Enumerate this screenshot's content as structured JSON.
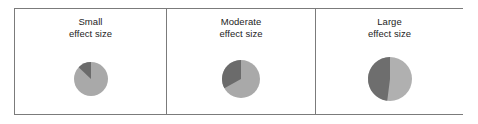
{
  "figure": {
    "border_color": "#7b7b7b",
    "background": "#ffffff",
    "caption_color": "#1d1d1d"
  },
  "panels": [
    {
      "name": "small",
      "caption": "Small\neffect size",
      "caption_line1": "Small",
      "caption_line2": "effect size",
      "pie_radius": 17,
      "center_x": 89,
      "center_y": 80
    },
    {
      "name": "moderate",
      "caption": "Moderate\neffect size",
      "caption_line1": "Moderate",
      "caption_line2": "effect size",
      "pie_radius": 19,
      "center_x": 238,
      "center_y": 82
    },
    {
      "name": "large",
      "caption": "Large\neffect size",
      "caption_line1": "Large",
      "caption_line2": "effect size",
      "pie_radius": 22,
      "center_x": 388,
      "center_y": 82
    }
  ],
  "chart_data": [
    {
      "type": "pie",
      "title": "Small effect size",
      "labels": [
        "overlap",
        "effect"
      ],
      "values": [
        87,
        13
      ],
      "colors": [
        "#a9a9a9",
        "#6b6b6b"
      ],
      "start_angle_deg": 0,
      "direction": "clockwise",
      "radius_px": 17,
      "legend": "none",
      "grid": false
    },
    {
      "type": "pie",
      "title": "Moderate effect size",
      "labels": [
        "overlap",
        "effect"
      ],
      "values": [
        67,
        33
      ],
      "colors": [
        "#a9a9a9",
        "#6b6b6b"
      ],
      "start_angle_deg": 0,
      "direction": "clockwise",
      "radius_px": 19,
      "legend": "none",
      "grid": false
    },
    {
      "type": "pie",
      "title": "Large effect size",
      "labels": [
        "overlap",
        "effect"
      ],
      "values": [
        52,
        48
      ],
      "colors": [
        "#b0b0b0",
        "#6e6e6e"
      ],
      "start_angle_deg": 0,
      "direction": "clockwise",
      "radius_px": 22,
      "legend": "none",
      "grid": false
    }
  ]
}
